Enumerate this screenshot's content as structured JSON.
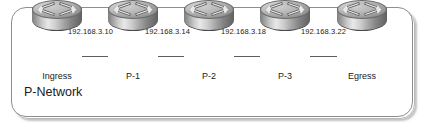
{
  "diagram": {
    "title": "P-Network",
    "frame": {
      "border_color": "#8e8e8e",
      "shadow_color": "#787878",
      "background": "#ffffff"
    },
    "link_color": "#5d5d5d",
    "nodes": [
      {
        "id": "ingress",
        "label": "Ingress",
        "icon": "router-icon",
        "x": 57
      },
      {
        "id": "p1",
        "label": "P-1",
        "icon": "router-icon",
        "x": 133
      },
      {
        "id": "p2",
        "label": "P-2",
        "icon": "router-icon",
        "x": 209
      },
      {
        "id": "p3",
        "label": "P-3",
        "icon": "router-icon",
        "x": 285
      },
      {
        "id": "egress",
        "label": "Egress",
        "icon": "router-icon",
        "x": 362
      }
    ],
    "links": [
      {
        "from": "ingress",
        "to": "p1",
        "ip": "192.168.3.10"
      },
      {
        "from": "p1",
        "to": "p2",
        "ip": "192.168.3.14"
      },
      {
        "from": "p2",
        "to": "p3",
        "ip": "192.168.3.18"
      },
      {
        "from": "p3",
        "to": "egress",
        "ip": "192.168.3.22"
      }
    ]
  }
}
